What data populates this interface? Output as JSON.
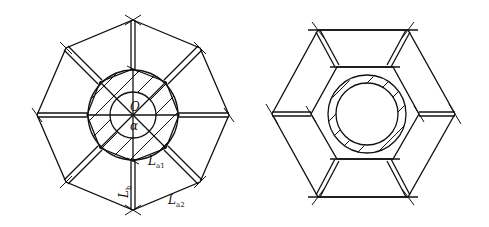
{
  "figure": {
    "left": {
      "shape": "octagon",
      "labels": {
        "center": "O",
        "angle": "α",
        "inner_edge": {
          "base": "L",
          "sub": "a1"
        },
        "outer_edge": {
          "base": "L",
          "sub": "a2"
        },
        "spoke": {
          "base": "L",
          "sub": "b"
        }
      }
    },
    "right": {
      "shape": "hexagon"
    }
  }
}
